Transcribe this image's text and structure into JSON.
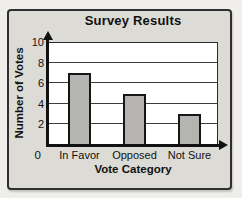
{
  "chart_data": {
    "type": "bar",
    "title": "Survey Results",
    "xlabel": "Vote Category",
    "ylabel": "Number of Votes",
    "categories": [
      "In Favor",
      "Opposed",
      "Not Sure"
    ],
    "values": [
      7,
      5,
      3
    ],
    "ylim": [
      0,
      10
    ],
    "yticks": [
      2,
      4,
      6,
      8,
      10
    ],
    "origin_label": "0",
    "grid": "horizontal",
    "legend": "none",
    "bar_color": "#b5b4b0",
    "bar_border_color": "#161616",
    "axis_color": "#111111",
    "gridline_color": "#3c3c3c"
  },
  "colors": {
    "page_background": "#efeeea",
    "card_background": "#dcdbd5",
    "card_border": "#2f2f2f",
    "plot_background": "#ffffff"
  }
}
